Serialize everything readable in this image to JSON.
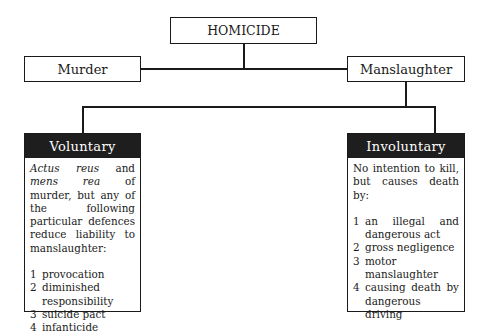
{
  "root": {
    "label": "HOMICIDE"
  },
  "branches": [
    {
      "label": "Murder"
    },
    {
      "label": "Manslaughter"
    }
  ],
  "manslaughter_types": [
    {
      "title": "Voluntary",
      "intro_italic_1": "Actus reus",
      "intro_mid": " and ",
      "intro_italic_2": "mens rea",
      "intro_rest": " of murder, but any of the following particular defences reduce liability to manslaughter:",
      "items": [
        {
          "num": "1",
          "text": "provocation"
        },
        {
          "num": "2",
          "text": "diminished responsibility"
        },
        {
          "num": "3",
          "text": "suicide pact"
        },
        {
          "num": "4",
          "text": "infanticide"
        }
      ]
    },
    {
      "title": "Involuntary",
      "intro": "No intention to kill, but causes death by:",
      "items": [
        {
          "num": "1",
          "text": "an illegal and dangerous act"
        },
        {
          "num": "2",
          "text": "gross negligence"
        },
        {
          "num": "3",
          "text": "motor manslaughter"
        },
        {
          "num": "4",
          "text": "causing death by dangerous driving"
        }
      ]
    }
  ]
}
